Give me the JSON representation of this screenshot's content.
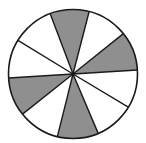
{
  "diagram": {
    "type": "fraction-circle",
    "total_sectors": 10,
    "shaded_sectors": 4,
    "center": [
      73,
      74
    ],
    "radius": 64.5,
    "colors": {
      "shaded": "#8f8f8f",
      "unshaded": "#ffffff",
      "stroke": "#1a1a1a"
    },
    "sectors": [
      {
        "start": -75.5,
        "end": -38.7,
        "shaded": false
      },
      {
        "start": -38.7,
        "end": -3.5,
        "shaded": true
      },
      {
        "start": -3.5,
        "end": 31,
        "shaded": false
      },
      {
        "start": 31,
        "end": 67,
        "shaded": false
      },
      {
        "start": 67,
        "end": 104,
        "shaded": true
      },
      {
        "start": 104,
        "end": 141.5,
        "shaded": false
      },
      {
        "start": 141.5,
        "end": 176.4,
        "shaded": true
      },
      {
        "start": 176.4,
        "end": 211.4,
        "shaded": false
      },
      {
        "start": 211.4,
        "end": 249.3,
        "shaded": false
      },
      {
        "start": 249.3,
        "end": 284.5,
        "shaded": true
      }
    ]
  }
}
